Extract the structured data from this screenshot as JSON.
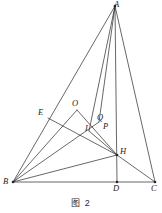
{
  "figure": {
    "caption": "图 2",
    "caption_pos": {
      "y": 196
    },
    "stroke_color": "#262626",
    "background": "#ffffff",
    "stroke_width": 0.7
  },
  "points": {
    "A": {
      "label": "A",
      "x": 115,
      "y": 6,
      "lx": 114,
      "ly": 0
    },
    "B": {
      "label": "B",
      "x": 13,
      "y": 182,
      "lx": 3,
      "ly": 177
    },
    "C": {
      "label": "C",
      "x": 155,
      "y": 182,
      "lx": 151,
      "ly": 184
    },
    "D": {
      "label": "D",
      "x": 117,
      "y": 182,
      "lx": 113,
      "ly": 184
    },
    "E": {
      "label": "E",
      "x": 48,
      "y": 118,
      "lx": 38,
      "ly": 108
    },
    "H": {
      "label": "H",
      "x": 117,
      "y": 155,
      "lx": 120,
      "ly": 147
    },
    "O": {
      "label": "O",
      "x": 77,
      "y": 110,
      "lx": 72,
      "ly": 99
    },
    "Q": {
      "label": "Q",
      "x": 99,
      "y": 122,
      "lx": 97,
      "ly": 113
    },
    "P": {
      "label": "P",
      "x": 102,
      "y": 128,
      "lx": 103,
      "ly": 122
    },
    "I": {
      "label": "I",
      "x": 89,
      "y": 131,
      "lx": 85,
      "ly": 124
    }
  },
  "segments": [
    {
      "name": "side-AB",
      "from": "A",
      "to": "B"
    },
    {
      "name": "side-AC",
      "from": "A",
      "to": "C"
    },
    {
      "name": "side-BC",
      "from": "B",
      "to": "C"
    },
    {
      "name": "altitude-AD",
      "from": "A",
      "to": "D"
    },
    {
      "name": "cevian-A-to-I",
      "from": "A",
      "to": "I"
    },
    {
      "name": "cevian-A-to-Q",
      "from": "A",
      "to": "Q"
    },
    {
      "name": "segment-B-to-O",
      "from": "B",
      "to": "O"
    },
    {
      "name": "segment-B-to-Q",
      "from": "B",
      "to": "Q"
    },
    {
      "name": "segment-B-to-H",
      "from": "B",
      "to": "H"
    },
    {
      "name": "segment-E-to-H",
      "from": "E",
      "to": "H"
    },
    {
      "name": "segment-O-to-H",
      "from": "O",
      "to": "H"
    },
    {
      "name": "segment-H-to-C",
      "from": "H",
      "to": "C"
    },
    {
      "name": "segment-I-to-H",
      "from": "I",
      "to": "H"
    }
  ],
  "labels_order": [
    "A",
    "E",
    "O",
    "Q",
    "P",
    "I",
    "H",
    "B",
    "D",
    "C"
  ]
}
